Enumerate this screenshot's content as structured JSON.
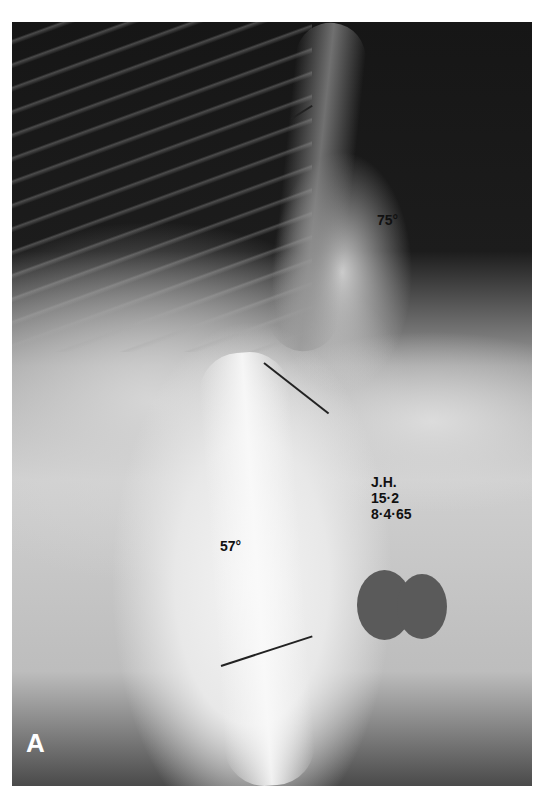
{
  "figure": {
    "panel_label": "A",
    "image_kind": "radiograph - spine with scoliosis curves",
    "annotations": {
      "upper_curve_angle": "75°",
      "lower_curve_angle": "57°",
      "patient_initials": "J.H.",
      "age": "15·2",
      "date": "8·4·65"
    },
    "colors": {
      "background": "#ffffff",
      "film_dark": "#161616",
      "film_light": "#e8e8e8",
      "annotation_text": "#111111",
      "panel_letter": "#ffffff"
    }
  }
}
